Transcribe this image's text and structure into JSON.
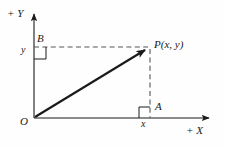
{
  "figure": {
    "background_color": "#fefefe",
    "ink_color": "#1a1a1a"
  },
  "axes": {
    "x_axis": {
      "label": "+ X",
      "origin_px": [
        34,
        118
      ],
      "arrow_tip_px": [
        214,
        118
      ],
      "direction": "right"
    },
    "y_axis": {
      "label": "+ Y",
      "origin_px": [
        34,
        118
      ],
      "arrow_tip_px": [
        34,
        9
      ],
      "direction": "up"
    }
  },
  "points": {
    "origin": {
      "label": "O",
      "px": [
        34,
        118
      ]
    },
    "P": {
      "label": "P(x, y)",
      "px": [
        150,
        47
      ]
    },
    "A": {
      "label": "A",
      "px": [
        150,
        118
      ],
      "description": "foot of perpendicular on X axis"
    },
    "B": {
      "label": "B",
      "px": [
        34,
        47
      ],
      "description": "foot of perpendicular on Y axis"
    }
  },
  "measures": {
    "x": {
      "label": "x",
      "description": "abscissa, distance along X axis from O to A"
    },
    "y": {
      "label": "y",
      "description": "ordinate, distance along Y axis from O to B"
    }
  },
  "segments": {
    "position_vector": {
      "name": "OP",
      "from_px": [
        34,
        118
      ],
      "to_px": [
        150,
        47
      ],
      "style": "solid-arrow"
    },
    "drop_to_x_axis": {
      "name": "PA",
      "from_px": [
        150,
        47
      ],
      "to_px": [
        150,
        118
      ],
      "style": "dashed"
    },
    "drop_to_y_axis": {
      "name": "PB",
      "from_px": [
        150,
        47
      ],
      "to_px": [
        34,
        47
      ],
      "style": "dashed"
    }
  },
  "right_angle_marks": [
    {
      "at": "A",
      "corner_px": [
        150,
        118
      ],
      "size_px": 11,
      "opens": "up-left"
    },
    {
      "at": "B",
      "corner_px": [
        34,
        47
      ],
      "size_px": 12,
      "opens": "down-right"
    }
  ]
}
